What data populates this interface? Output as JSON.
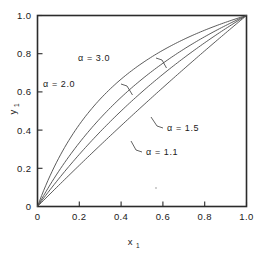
{
  "chart_data": {
    "type": "line",
    "title": "",
    "subtitle": "",
    "xlabel": "x",
    "xlabel_sub": "1",
    "ylabel": "y",
    "ylabel_sub": "1",
    "xlim": [
      0,
      1.0
    ],
    "ylim": [
      0,
      1.0
    ],
    "grid": false,
    "legend_position": "inline-annotations",
    "x_ticks": [
      "0",
      "0.2",
      "0.4",
      "0.6",
      "0.8",
      "1.0"
    ],
    "x_tick_values": [
      0,
      0.2,
      0.4,
      0.6,
      0.8,
      1.0
    ],
    "y_ticks": [
      "0",
      "0.2",
      "0.4",
      "0.6",
      "0.8",
      "1.0"
    ],
    "y_tick_values": [
      0,
      0.2,
      0.4,
      0.6,
      0.8,
      1.0
    ],
    "equation": "y = a*x / (1 + (a-1)*x)",
    "series": [
      {
        "name": "α = 3.0",
        "alpha": 3.0,
        "x": [
          0,
          0.05,
          0.1,
          0.15,
          0.2,
          0.25,
          0.3,
          0.35,
          0.4,
          0.45,
          0.5,
          0.55,
          0.6,
          0.65,
          0.7,
          0.75,
          0.8,
          0.85,
          0.9,
          0.95,
          1.0
        ],
        "values": [
          0,
          0.136,
          0.25,
          0.346,
          0.429,
          0.5,
          0.562,
          0.618,
          0.667,
          0.711,
          0.75,
          0.786,
          0.818,
          0.848,
          0.875,
          0.9,
          0.923,
          0.944,
          0.964,
          0.983,
          1.0
        ]
      },
      {
        "name": "α = 2.0",
        "alpha": 2.0,
        "x": [
          0,
          0.05,
          0.1,
          0.15,
          0.2,
          0.25,
          0.3,
          0.35,
          0.4,
          0.45,
          0.5,
          0.55,
          0.6,
          0.65,
          0.7,
          0.75,
          0.8,
          0.85,
          0.9,
          0.95,
          1.0
        ],
        "values": [
          0,
          0.095,
          0.182,
          0.261,
          0.333,
          0.4,
          0.462,
          0.519,
          0.571,
          0.621,
          0.667,
          0.71,
          0.75,
          0.788,
          0.824,
          0.857,
          0.889,
          0.919,
          0.947,
          0.974,
          1.0
        ]
      },
      {
        "name": "α = 1.5",
        "alpha": 1.5,
        "x": [
          0,
          0.05,
          0.1,
          0.15,
          0.2,
          0.25,
          0.3,
          0.35,
          0.4,
          0.45,
          0.5,
          0.55,
          0.6,
          0.65,
          0.7,
          0.75,
          0.8,
          0.85,
          0.9,
          0.95,
          1.0
        ],
        "values": [
          0,
          0.073,
          0.143,
          0.209,
          0.273,
          0.333,
          0.391,
          0.447,
          0.5,
          0.551,
          0.6,
          0.647,
          0.692,
          0.736,
          0.778,
          0.818,
          0.857,
          0.895,
          0.931,
          0.966,
          1.0
        ]
      },
      {
        "name": "α = 1.1",
        "alpha": 1.1,
        "x": [
          0,
          0.05,
          0.1,
          0.15,
          0.2,
          0.25,
          0.3,
          0.35,
          0.4,
          0.45,
          0.5,
          0.55,
          0.6,
          0.65,
          0.7,
          0.75,
          0.8,
          0.85,
          0.9,
          0.95,
          1.0
        ],
        "values": [
          0,
          0.0548,
          0.109,
          0.163,
          0.216,
          0.268,
          0.32,
          0.372,
          0.423,
          0.474,
          0.524,
          0.573,
          0.623,
          0.671,
          0.72,
          0.767,
          0.815,
          0.862,
          0.908,
          0.954,
          1.0
        ]
      }
    ],
    "annotations": [
      {
        "id": "a30",
        "label": "α = 3.0",
        "alpha": 3.0
      },
      {
        "id": "a20",
        "label": "α = 2.0",
        "alpha": 2.0
      },
      {
        "id": "a15",
        "label": "α = 1.5",
        "alpha": 1.5
      },
      {
        "id": "a11",
        "label": "α = 1.1",
        "alpha": 1.1
      }
    ],
    "colors": {
      "axis": "#2b2b2b",
      "curve": "#4a4a4a",
      "text": "#1a1a1a",
      "background": "#ffffff"
    }
  }
}
